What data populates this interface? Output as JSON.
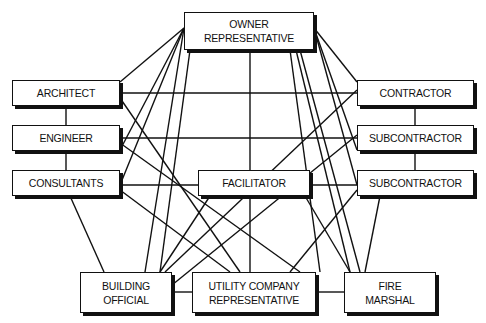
{
  "diagram": {
    "type": "network",
    "nodes": [
      {
        "id": "owner",
        "lines": [
          "OWNER",
          "REPRESENTATIVE"
        ],
        "box": [
          184,
          12,
          130,
          38
        ]
      },
      {
        "id": "architect",
        "lines": [
          "ARCHITECT"
        ],
        "box": [
          12,
          80,
          108,
          26
        ]
      },
      {
        "id": "engineer",
        "lines": [
          "ENGINEER"
        ],
        "box": [
          12,
          125,
          108,
          26
        ]
      },
      {
        "id": "consultants",
        "lines": [
          "CONSULTANTS"
        ],
        "box": [
          12,
          170,
          108,
          26
        ]
      },
      {
        "id": "contractor",
        "lines": [
          "CONTRACTOR"
        ],
        "box": [
          357,
          80,
          117,
          26
        ]
      },
      {
        "id": "subcontractor1",
        "lines": [
          "SUBCONTRACTOR"
        ],
        "box": [
          357,
          125,
          117,
          26
        ]
      },
      {
        "id": "subcontractor2",
        "lines": [
          "SUBCONTRACTOR"
        ],
        "box": [
          357,
          170,
          117,
          26
        ]
      },
      {
        "id": "facilitator",
        "lines": [
          "FACILITATOR"
        ],
        "box": [
          198,
          170,
          112,
          26
        ]
      },
      {
        "id": "building_official",
        "lines": [
          "BUILDING",
          "OFFICIAL"
        ],
        "box": [
          80,
          272,
          92,
          41
        ]
      },
      {
        "id": "utility",
        "lines": [
          "UTILITY COMPANY",
          "REPRESENTATIVE"
        ],
        "box": [
          192,
          272,
          124,
          41
        ]
      },
      {
        "id": "fire_marshal",
        "lines": [
          "FIRE",
          "MARSHAL"
        ],
        "box": [
          344,
          272,
          92,
          41
        ]
      }
    ],
    "edges": [
      [
        250,
        50,
        250,
        170
      ],
      [
        184,
        28,
        120,
        82
      ],
      [
        184,
        28,
        120,
        150
      ],
      [
        184,
        28,
        120,
        185
      ],
      [
        184,
        28,
        145,
        272
      ],
      [
        190,
        50,
        160,
        272
      ],
      [
        314,
        28,
        357,
        82
      ],
      [
        314,
        28,
        357,
        150
      ],
      [
        314,
        28,
        357,
        185
      ],
      [
        300,
        50,
        360,
        272
      ],
      [
        296,
        50,
        350,
        272
      ],
      [
        290,
        50,
        320,
        272
      ],
      [
        120,
        93,
        357,
        93
      ],
      [
        120,
        138,
        357,
        138
      ],
      [
        120,
        185,
        198,
        185
      ],
      [
        310,
        185,
        357,
        185
      ],
      [
        120,
        98,
        240,
        272
      ],
      [
        120,
        143,
        300,
        272
      ],
      [
        120,
        190,
        230,
        272
      ],
      [
        66,
        106,
        66,
        125
      ],
      [
        66,
        151,
        66,
        170
      ],
      [
        415,
        106,
        415,
        125
      ],
      [
        415,
        151,
        415,
        170
      ],
      [
        70,
        196,
        104,
        272
      ],
      [
        357,
        90,
        165,
        272
      ],
      [
        357,
        135,
        172,
        285
      ],
      [
        357,
        190,
        290,
        272
      ],
      [
        380,
        196,
        365,
        272
      ],
      [
        250,
        196,
        250,
        272
      ],
      [
        210,
        196,
        160,
        272
      ],
      [
        305,
        196,
        350,
        272
      ],
      [
        172,
        292,
        192,
        292
      ],
      [
        316,
        292,
        344,
        292
      ]
    ]
  }
}
